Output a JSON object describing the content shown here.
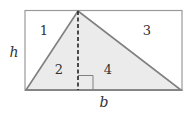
{
  "diagram": {
    "type": "rectangle-triangle-area",
    "regions": [
      {
        "id": "region-1",
        "label": "1"
      },
      {
        "id": "region-2",
        "label": "2"
      },
      {
        "id": "region-3",
        "label": "3"
      },
      {
        "id": "region-4",
        "label": "4"
      }
    ],
    "height_label": "h",
    "base_label": "b",
    "colors": {
      "stroke": "#808080",
      "triangle_fill": "#ebebeb",
      "dashed_line": "#222222",
      "text": "#333333"
    }
  }
}
